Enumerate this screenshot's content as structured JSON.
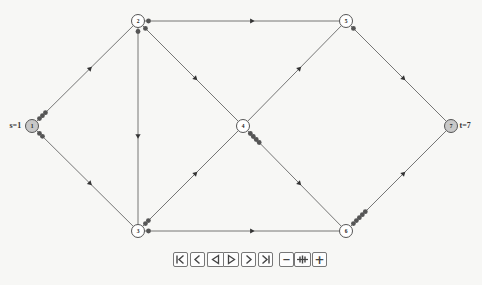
{
  "diagram": {
    "type": "flow-network",
    "colors": {
      "background": "#f7f7f5",
      "edge": "#666666",
      "node_stroke": "#555555",
      "node_fill": "#ffffff",
      "terminal_fill": "#c8c8c8",
      "unit_dot": "#555555"
    },
    "nodes": [
      {
        "id": "1",
        "label": "1",
        "x": 32,
        "y": 126,
        "terminal": true,
        "side_label": "s=1",
        "side": "left"
      },
      {
        "id": "2",
        "label": "2",
        "x": 138,
        "y": 21,
        "terminal": false
      },
      {
        "id": "3",
        "label": "3",
        "x": 138,
        "y": 231,
        "terminal": false
      },
      {
        "id": "4",
        "label": "4",
        "x": 243,
        "y": 126,
        "terminal": false
      },
      {
        "id": "5",
        "label": "5",
        "x": 346,
        "y": 21,
        "terminal": false
      },
      {
        "id": "6",
        "label": "6",
        "x": 346,
        "y": 231,
        "terminal": false
      },
      {
        "id": "7",
        "label": "7",
        "x": 451,
        "y": 126,
        "terminal": true,
        "side_label": "t=7",
        "side": "right"
      }
    ],
    "edges": [
      {
        "from": "1",
        "to": "2",
        "units": 3
      },
      {
        "from": "1",
        "to": "3",
        "units": 2
      },
      {
        "from": "2",
        "to": "5",
        "units": 1
      },
      {
        "from": "2",
        "to": "4",
        "units": 1
      },
      {
        "from": "2",
        "to": "3",
        "units": 1
      },
      {
        "from": "3",
        "to": "4",
        "units": 2
      },
      {
        "from": "3",
        "to": "6",
        "units": 1
      },
      {
        "from": "4",
        "to": "5",
        "units": 0
      },
      {
        "from": "4",
        "to": "6",
        "units": 4
      },
      {
        "from": "5",
        "to": "7",
        "units": 1
      },
      {
        "from": "6",
        "to": "7",
        "units": 5
      }
    ]
  },
  "controls": {
    "playback": [
      {
        "name": "first-button",
        "icon": "skip-to-start-icon"
      },
      {
        "name": "prev-button",
        "icon": "step-back-icon"
      },
      {
        "name": "play-backward-button",
        "icon": "play-backward-icon"
      },
      {
        "name": "play-forward-button",
        "icon": "play-forward-icon"
      },
      {
        "name": "next-button",
        "icon": "step-forward-icon"
      },
      {
        "name": "last-button",
        "icon": "skip-to-end-icon"
      }
    ],
    "speed": [
      {
        "name": "slower-button",
        "icon": "minus-icon",
        "glyph": "−"
      },
      {
        "name": "reset-speed-button",
        "icon": "speed-reset-icon"
      },
      {
        "name": "faster-button",
        "icon": "plus-icon",
        "glyph": "+"
      }
    ]
  }
}
